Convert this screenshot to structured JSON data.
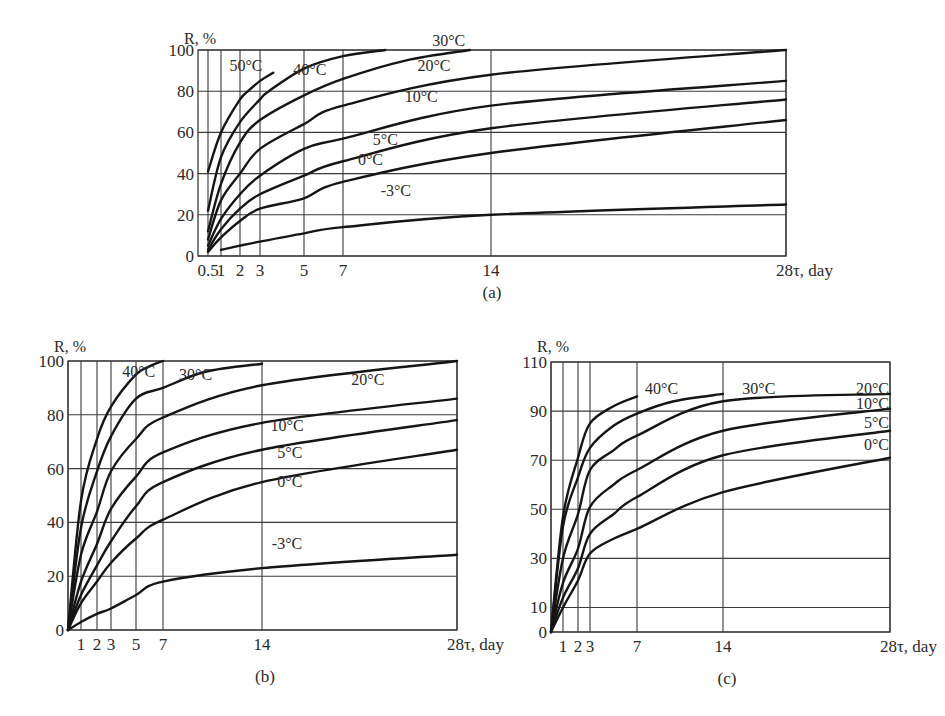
{
  "figure": {
    "panel_labels": [
      "(a)",
      "(b)",
      "(c)"
    ]
  },
  "chart_data": [
    {
      "id": "a",
      "type": "line",
      "title": "(a)",
      "xlabel": "τ, day",
      "ylabel": "R, %",
      "x_ticks": [
        0.5,
        1,
        2,
        3,
        5,
        7,
        14,
        28
      ],
      "x_tick_labels": [
        "0.5",
        "1",
        "2",
        "3",
        "5",
        "7",
        "14",
        "28"
      ],
      "y_ticks": [
        0,
        20,
        40,
        60,
        80,
        100
      ],
      "xlim": [
        0.5,
        28
      ],
      "ylim": [
        0,
        100
      ],
      "grid": true,
      "legend": "inline labels",
      "series": [
        {
          "name": "50°C",
          "x": [
            0.5,
            1,
            2,
            2.4,
            3,
            3.6
          ],
          "values": [
            41,
            60,
            76,
            80,
            85,
            89
          ]
        },
        {
          "name": "40°C",
          "x": [
            0.5,
            1,
            2,
            3,
            3.4,
            5,
            7,
            9
          ],
          "values": [
            22,
            48,
            65,
            76,
            80,
            91,
            97,
            100
          ]
        },
        {
          "name": "30°C",
          "x": [
            0.5,
            1,
            2,
            3,
            5,
            7,
            10,
            13
          ],
          "values": [
            12,
            35,
            55,
            66,
            78,
            86,
            95,
            100
          ]
        },
        {
          "name": "20°C",
          "x": [
            0.5,
            1,
            2,
            3,
            5,
            7,
            14,
            28
          ],
          "values": [
            8,
            27,
            40,
            52,
            64,
            73,
            88,
            100
          ]
        },
        {
          "name": "10°C",
          "x": [
            0.5,
            1,
            2,
            3,
            5,
            7,
            14,
            28
          ],
          "values": [
            5,
            18,
            30,
            39,
            52,
            57,
            73,
            85
          ]
        },
        {
          "name": "5°C",
          "x": [
            0.5,
            1,
            2,
            3,
            5,
            7,
            14,
            28
          ],
          "values": [
            3,
            13,
            23,
            30,
            39,
            46,
            62,
            76
          ]
        },
        {
          "name": "0°C",
          "x": [
            0.5,
            1,
            2,
            3,
            5,
            7,
            14,
            28
          ],
          "values": [
            2,
            9,
            17,
            23,
            28,
            36,
            50,
            66
          ]
        },
        {
          "name": "-3°C",
          "x": [
            1,
            2,
            3,
            5,
            7,
            14,
            28
          ],
          "values": [
            3,
            5,
            7,
            11,
            14,
            20,
            25
          ]
        }
      ],
      "labels": [
        {
          "text": "50°C",
          "x": 2.3,
          "y": 90
        },
        {
          "text": "40°C",
          "x": 5.3,
          "y": 88
        },
        {
          "text": "30°C",
          "x": 12.0,
          "y": 102
        },
        {
          "text": "20°C",
          "x": 11.3,
          "y": 90
        },
        {
          "text": "10°C",
          "x": 10.7,
          "y": 75
        },
        {
          "text": "5°C",
          "x": 9.0,
          "y": 54
        },
        {
          "text": "0°C",
          "x": 8.3,
          "y": 44
        },
        {
          "text": "-3°C",
          "x": 9.5,
          "y": 29
        }
      ],
      "axis_label_x": "28τ, day"
    },
    {
      "id": "b",
      "type": "line",
      "title": "(b)",
      "xlabel": "τ, day",
      "ylabel": "R, %",
      "x_ticks": [
        0,
        1,
        2,
        3,
        5,
        7,
        14,
        28
      ],
      "x_tick_labels": [
        "",
        "1",
        "2",
        "3",
        "5",
        "7",
        "14",
        "28"
      ],
      "y_ticks": [
        0,
        20,
        40,
        60,
        80,
        100
      ],
      "xlim": [
        0,
        28
      ],
      "ylim": [
        0,
        100
      ],
      "grid": true,
      "legend": "inline labels",
      "series": [
        {
          "name": "40°C",
          "x": [
            0,
            1,
            2,
            3,
            5,
            6,
            7
          ],
          "values": [
            0,
            48,
            71,
            83,
            95,
            98,
            100
          ]
        },
        {
          "name": "30°C",
          "x": [
            0,
            1,
            2,
            3,
            5,
            7,
            10,
            14
          ],
          "values": [
            0,
            38,
            59,
            72,
            86,
            90,
            96,
            99
          ]
        },
        {
          "name": "20°C",
          "x": [
            0,
            1,
            2,
            3,
            5,
            7,
            14,
            28
          ],
          "values": [
            0,
            28,
            44,
            59,
            71,
            79,
            91,
            100
          ]
        },
        {
          "name": "10°C",
          "x": [
            0,
            1,
            2,
            3,
            5,
            7,
            14,
            28
          ],
          "values": [
            0,
            18,
            32,
            45,
            57,
            66,
            77,
            86
          ]
        },
        {
          "name": "5°C",
          "x": [
            0,
            1,
            2,
            3,
            5,
            7,
            14,
            28
          ],
          "values": [
            0,
            13,
            24,
            33,
            46,
            55,
            67,
            78
          ]
        },
        {
          "name": "0°C",
          "x": [
            0,
            1,
            2,
            3,
            5,
            7,
            14,
            28
          ],
          "values": [
            0,
            10,
            18,
            25,
            34,
            41,
            55,
            67
          ]
        },
        {
          "name": "-3°C",
          "x": [
            0,
            1,
            2,
            3,
            5,
            7,
            14,
            28
          ],
          "values": [
            0,
            3,
            6,
            8,
            13,
            18,
            23,
            28
          ]
        }
      ],
      "labels": [
        {
          "text": "40°C",
          "x": 5.2,
          "y": 94
        },
        {
          "text": "30°C",
          "x": 9.3,
          "y": 93
        },
        {
          "text": "20°C",
          "x": 21.6,
          "y": 91
        },
        {
          "text": "10°C",
          "x": 15.8,
          "y": 74
        },
        {
          "text": "5°C",
          "x": 16.0,
          "y": 64
        },
        {
          "text": "0°C",
          "x": 16.0,
          "y": 53
        },
        {
          "text": "-3°C",
          "x": 15.8,
          "y": 30
        }
      ],
      "axis_label_x": "28τ, day"
    },
    {
      "id": "c",
      "type": "line",
      "title": "(c)",
      "xlabel": "τ, day",
      "ylabel": "R, %",
      "x_ticks": [
        0,
        1,
        2,
        3,
        7,
        14,
        28
      ],
      "x_tick_labels": [
        "",
        "1",
        "2",
        "3",
        "7",
        "14",
        "28"
      ],
      "y_ticks": [
        0,
        10,
        30,
        50,
        70,
        90,
        110
      ],
      "xlim": [
        0,
        28
      ],
      "ylim": [
        0,
        110
      ],
      "grid": true,
      "legend": "inline labels",
      "series": [
        {
          "name": "40°C",
          "x": [
            0,
            1,
            2,
            3,
            5,
            7
          ],
          "values": [
            0,
            47,
            71,
            85,
            92,
            96
          ]
        },
        {
          "name": "30°C",
          "x": [
            0,
            1,
            2,
            3,
            5,
            7,
            10,
            14
          ],
          "values": [
            0,
            43,
            63,
            75,
            84,
            89,
            94,
            97
          ]
        },
        {
          "name": "20°C",
          "x": [
            0,
            1,
            2,
            3,
            5,
            7,
            14,
            28
          ],
          "values": [
            0,
            30,
            48,
            66,
            74,
            80,
            94,
            97
          ]
        },
        {
          "name": "10°C",
          "x": [
            0,
            1,
            2,
            3,
            5,
            7,
            14,
            28
          ],
          "values": [
            0,
            20,
            34,
            51,
            60,
            66,
            82,
            91
          ]
        },
        {
          "name": "5°C",
          "x": [
            0,
            1,
            2,
            3,
            5,
            7,
            14,
            28
          ],
          "values": [
            0,
            14,
            26,
            40,
            48,
            55,
            72,
            82
          ]
        },
        {
          "name": "0°C",
          "x": [
            0,
            1,
            2,
            3,
            5,
            7,
            14,
            28
          ],
          "values": [
            0,
            10,
            21,
            32,
            38,
            42,
            57,
            71
          ]
        }
      ],
      "labels": [
        {
          "text": "40°C",
          "x": 9.0,
          "y": 97
        },
        {
          "text": "30°C",
          "x": 17.0,
          "y": 97
        },
        {
          "text": "20°C",
          "x": 26.8,
          "y": 97
        },
        {
          "text": "10°C",
          "x": 26.4,
          "y": 91
        },
        {
          "text": "5°C",
          "x": 26.6,
          "y": 83
        },
        {
          "text": "0°C",
          "x": 26.6,
          "y": 74
        }
      ],
      "axis_label_x": "28τ, day"
    }
  ]
}
